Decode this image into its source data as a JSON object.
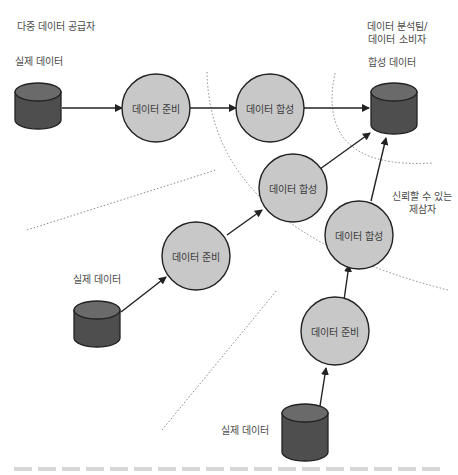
{
  "labels": {
    "providers_title": "다중 데이터 공급자",
    "consumer_title_line1": "데이터 분석팀/",
    "consumer_title_line2": "데이터 소비자",
    "synthetic_data": "합성 데이터",
    "real_data_top": "실제 데이터",
    "real_data_middle": "실제 데이터",
    "real_data_bottom": "실제 데이터",
    "trusted_line1": "신뢰할 수 있는",
    "trusted_line2": "제삼자"
  },
  "nodes": {
    "prep_top": "데이터 준비",
    "synth_top": "데이터 합성",
    "synth_middle": "데이터 합성",
    "prep_middle": "데이터 준비",
    "synth_right": "데이터 합성",
    "prep_bottom": "데이터 준비"
  },
  "colors": {
    "circle_fill": "#c8c8c8",
    "cylinder_fill": "#555555",
    "stroke": "#222222",
    "dotted": "#888888"
  }
}
